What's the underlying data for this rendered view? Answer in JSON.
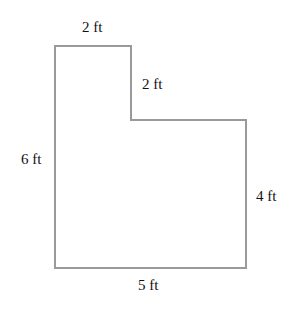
{
  "diagram": {
    "type": "L-shaped floor plan (rectilinear polygon)",
    "stroke_color": "#9a9a9a",
    "vertices": [
      [
        55,
        46
      ],
      [
        131,
        46
      ],
      [
        131,
        120
      ],
      [
        246,
        120
      ],
      [
        246,
        268
      ],
      [
        55,
        268
      ]
    ],
    "labels": {
      "top": "2 ft",
      "notch_vertical": "2 ft",
      "left": "6 ft",
      "right": "4 ft",
      "bottom": "5 ft"
    }
  }
}
